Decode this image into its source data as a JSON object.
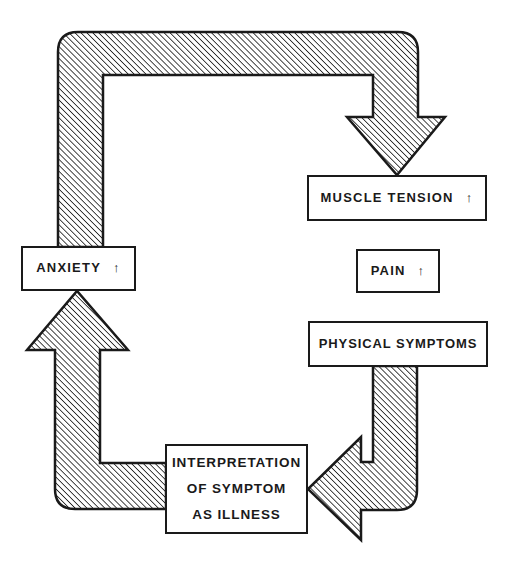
{
  "diagram": {
    "type": "cycle",
    "colors": {
      "stroke": "#1a1a1a",
      "background": "#ffffff",
      "hatch": "#1a1a1a"
    },
    "nodes": {
      "anxiety": {
        "label": "ANXIETY",
        "indicator": "↑"
      },
      "muscle_tension": {
        "label": "MUSCLE TENSION",
        "indicator": "↑"
      },
      "pain": {
        "label": "PAIN",
        "indicator": "↑"
      },
      "physical_symptoms": {
        "label": "PHYSICAL SYMPTOMS"
      },
      "interpretation": {
        "lines": [
          "INTERPRETATION",
          "OF SYMPTOM",
          "AS ILLNESS"
        ]
      }
    },
    "edges": [
      {
        "from": "ANXIETY",
        "to": "MUSCLE TENSION",
        "style": "hatched-arrow"
      },
      {
        "from": "PHYSICAL SYMPTOMS",
        "to": "INTERPRETATION OF SYMPTOM AS ILLNESS",
        "style": "hatched-arrow"
      },
      {
        "from": "INTERPRETATION OF SYMPTOM AS ILLNESS",
        "to": "ANXIETY",
        "style": "hatched-arrow"
      }
    ]
  }
}
